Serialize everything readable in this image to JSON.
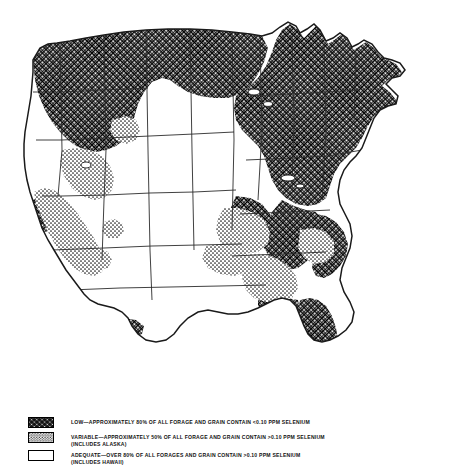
{
  "figure": {
    "type": "choropleth-map",
    "region": "United States (conterminous)"
  },
  "legend": {
    "entries": [
      {
        "pattern": "crosshatch",
        "label": "LOW—APPROXIMATELY 80% OF ALL FORAGE AND GRAIN CONTAIN <0.10 PPM SELENIUM",
        "sub": "",
        "category": "LOW",
        "percent": "80%",
        "threshold": "<0.10 PPM SELENIUM"
      },
      {
        "pattern": "stipple",
        "label": "VARIABLE—APPROXIMATELY 50% OF ALL FORAGE AND GRAIN CONTAIN >0.10 PPM SELENIUM",
        "sub": "(INCLUDES ALASKA)",
        "category": "VARIABLE",
        "percent": "50%",
        "threshold": ">0.10 PPM SELENIUM"
      },
      {
        "pattern": "blank",
        "label": "ADEQUATE—OVER 80% OF ALL FORAGES AND GRAIN CONTAIN >0.10 PPM SELENIUM",
        "sub": "(INCLUDES HAWAII)",
        "category": "ADEQUATE",
        "percent": "80%",
        "threshold": ">0.10 PPM SELENIUM"
      }
    ]
  },
  "map": {
    "colors": {
      "outline": "#1a1a1a",
      "state_border": "#2b2b2b",
      "low_fill": "#000000",
      "variable_fill": "#000000",
      "adequate_fill": "#ffffff",
      "background": "#ffffff"
    },
    "regions": {
      "low": "Pacific Northwest, Northern Plains, Great Lakes, Northeast, Appalachia, Florida, Southeast coastal",
      "variable": "California, Nevada, Arizona, Idaho-Utah belt, Ohio Valley, Southeast interior",
      "adequate": "Great Plains, Rocky Mountain interior, Texas, Gulf Coast"
    }
  }
}
